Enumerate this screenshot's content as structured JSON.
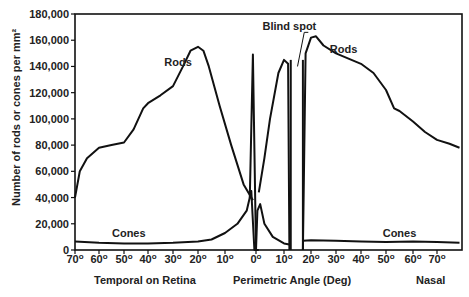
{
  "chart_data": {
    "type": "line",
    "title": "",
    "ylabel": "Number of rods or cones per mm²",
    "xlabel": "Perimetric Angle (Deg)",
    "x_region_labels": {
      "left": "Temporal on Retina",
      "center": "Perimetric Angle (Deg)",
      "right": "Nasal"
    },
    "ylim": [
      0,
      180000
    ],
    "yticks": [
      "0",
      "20,000",
      "40,000",
      "60,000",
      "80,000",
      "100,000",
      "120,000",
      "140,000",
      "160,000",
      "180,000"
    ],
    "xlim": [
      -70,
      80
    ],
    "xticks": [
      -70,
      -60,
      -50,
      -40,
      -30,
      -20,
      -10,
      0,
      10,
      20,
      30,
      40,
      50,
      60,
      70
    ],
    "xtick_labels": [
      "70°",
      "60°",
      "50°",
      "40°",
      "30°",
      "20°",
      "10°",
      "0°",
      "10°",
      "20°",
      "30°",
      "40°",
      "50°",
      "60°",
      "70°"
    ],
    "annotations": [
      {
        "text": "Rods",
        "x": -28,
        "y": 140000
      },
      {
        "text": "Rods",
        "x": 33,
        "y": 150000
      },
      {
        "text": "Cones",
        "x": -48,
        "y": 10000
      },
      {
        "text": "Cones",
        "x": 55,
        "y": 10000
      },
      {
        "text": "Blind spot",
        "x": 12,
        "y": 168000
      }
    ],
    "blind_spot_range": [
      12.5,
      17
    ],
    "series": [
      {
        "name": "Rods (temporal)",
        "x": [
          -70,
          -68,
          -65,
          -60,
          -55,
          -50,
          -46,
          -42,
          -40,
          -35,
          -30,
          -26,
          -23,
          -20,
          -18,
          -16,
          -12,
          -8,
          -4,
          -1
        ],
        "y": [
          40000,
          60000,
          70000,
          78000,
          80000,
          82000,
          92000,
          108000,
          112000,
          118000,
          125000,
          140000,
          152000,
          155000,
          152000,
          140000,
          110000,
          80000,
          50000,
          38000
        ]
      },
      {
        "name": "Rods (spike)",
        "x": [
          -2,
          -1,
          0,
          1
        ],
        "y": [
          40000,
          149000,
          0,
          0
        ]
      },
      {
        "name": "Rods (near nasal)",
        "x": [
          1,
          3,
          5,
          8,
          10,
          11.5,
          12
        ],
        "y": [
          44000,
          70000,
          100000,
          135000,
          145000,
          142000,
          0
        ]
      },
      {
        "name": "Rods (nasal)",
        "x": [
          17,
          18,
          20,
          22,
          25,
          30,
          40,
          45,
          50,
          53,
          55,
          60,
          65,
          70,
          75,
          79
        ],
        "y": [
          0,
          150000,
          162000,
          163000,
          156000,
          150000,
          142000,
          135000,
          122000,
          108000,
          106000,
          98000,
          90000,
          84000,
          81000,
          78000
        ]
      },
      {
        "name": "Cones",
        "x": [
          -70,
          -60,
          -50,
          -40,
          -30,
          -20,
          -15,
          -10,
          -6,
          -3,
          -1.5,
          -0.5,
          0,
          0.5,
          1.5,
          3,
          6,
          10,
          12.5
        ],
        "y": [
          6500,
          5500,
          5000,
          5000,
          5500,
          6500,
          8000,
          13000,
          20000,
          30000,
          45000,
          0,
          0,
          30000,
          35000,
          20000,
          10000,
          5000,
          4000
        ]
      },
      {
        "name": "Cones (nasal)",
        "x": [
          17,
          20,
          30,
          40,
          50,
          60,
          70,
          79
        ],
        "y": [
          7000,
          7500,
          7000,
          6500,
          6000,
          6500,
          6000,
          5500
        ]
      }
    ],
    "grid": false,
    "legend": "none"
  }
}
